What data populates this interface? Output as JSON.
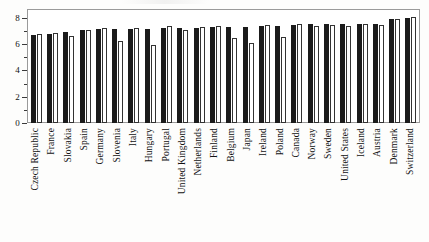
{
  "chart_data": {
    "type": "bar",
    "title": "",
    "subtitle": "",
    "xlabel": "",
    "ylabel": "",
    "ylim": [
      0,
      8.6
    ],
    "yticks": [
      0,
      2,
      4,
      6,
      8
    ],
    "ytick_labels": [
      "0",
      "2",
      "4",
      "6",
      "8"
    ],
    "yminor_ticks": [
      1,
      3,
      5,
      7
    ],
    "grid": false,
    "legend_position": "none",
    "orientation": "vertical",
    "bar_style": [
      "solid-black",
      "white-outlined"
    ],
    "categories": [
      "Czech Republic",
      "France",
      "Slovakia",
      "Spain",
      "Germany",
      "Slovenia",
      "Italy",
      "Hungary",
      "Portugal",
      "United Kingdom",
      "Netherlands",
      "Finland",
      "Belgium",
      "Japan",
      "Ireland",
      "Poland",
      "Canada",
      "Norway",
      "Sweden",
      "United States",
      "Iceland",
      "Austria",
      "Denmark",
      "Switzerland"
    ],
    "series": [
      {
        "name": "series-1",
        "style": "solid-black",
        "values": [
          6.7,
          6.8,
          6.95,
          7.05,
          7.15,
          7.15,
          7.15,
          7.15,
          7.2,
          7.2,
          7.2,
          7.3,
          7.3,
          7.3,
          7.4,
          7.4,
          7.45,
          7.5,
          7.5,
          7.5,
          7.55,
          7.55,
          7.9,
          8.0
        ]
      },
      {
        "name": "series-2",
        "style": "white-outlined",
        "values": [
          6.75,
          6.85,
          6.65,
          7.1,
          7.2,
          6.25,
          7.2,
          5.95,
          7.35,
          7.1,
          7.3,
          7.35,
          6.5,
          6.1,
          7.45,
          6.55,
          7.55,
          7.4,
          7.45,
          7.4,
          7.55,
          7.45,
          7.95,
          8.1
        ]
      }
    ]
  }
}
